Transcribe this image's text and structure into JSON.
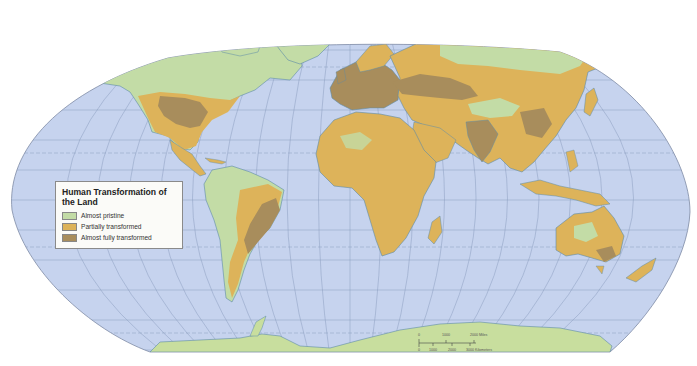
{
  "map": {
    "title": "Human Transformation of the Land",
    "projection": "Robinson",
    "colors": {
      "ocean": "#c6d3ee",
      "graticule": "#8b9dbf",
      "coast": "#5e8ca8",
      "almost_pristine": "#c3dca6",
      "partially_transformed": "#ddb35a",
      "almost_fully_transformed": "#a88d5c",
      "antarctica": "#c8de9e"
    },
    "legend": {
      "title": "Human Transformation of the Land",
      "items": [
        {
          "label": "Almost pristine",
          "color": "#c3dca6"
        },
        {
          "label": "Partially transformed",
          "color": "#ddb35a"
        },
        {
          "label": "Almost fully transformed",
          "color": "#a88d5c"
        }
      ]
    },
    "scale_bar": {
      "miles_ticks": [
        "0",
        "1000",
        "2000 Miles"
      ],
      "km_ticks": [
        "0",
        "1000",
        "2000",
        "3000 Kilometers"
      ]
    },
    "regions": [
      {
        "name": "North America",
        "class": "mixed"
      },
      {
        "name": "South America",
        "class": "mixed"
      },
      {
        "name": "Europe",
        "class": "almost_fully_transformed"
      },
      {
        "name": "Africa",
        "class": "partially_transformed"
      },
      {
        "name": "Asia",
        "class": "mixed"
      },
      {
        "name": "Australia",
        "class": "mixed"
      },
      {
        "name": "Greenland",
        "class": "almost_pristine"
      },
      {
        "name": "Antarctica",
        "class": "almost_pristine"
      }
    ]
  }
}
